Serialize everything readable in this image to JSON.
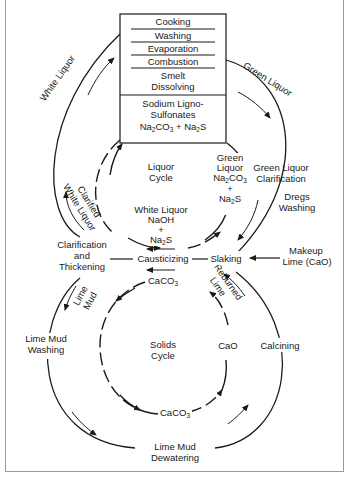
{
  "diagram": {
    "title_box": {
      "steps": [
        "Cooking",
        "Washing",
        "Evaporation",
        "Combustion",
        "Smelt",
        "Dissolving"
      ],
      "products": {
        "line1": "Sodium Ligno-",
        "line2": "Sulfonates",
        "formula_a": "Na",
        "formula_a_sub": "2",
        "formula_a_rest": "CO",
        "formula_a_sub2": "3",
        "plus": "+",
        "formula_b": "Na",
        "formula_b_sub": "2",
        "formula_b_rest": "S"
      }
    },
    "outer_labels": {
      "white_liquor": "White Liquor",
      "green_liquor": "Green Liquor",
      "green_liquor_clarification_1": "Green Liquor",
      "green_liquor_clarification_2": "Clarification",
      "dregs_washing_1": "Dregs",
      "dregs_washing_2": "Washing",
      "clarified_white_liquor_1": "Clarified",
      "clarified_white_liquor_2": "White Liquor",
      "clarification_1": "Clarification",
      "clarification_2": "and",
      "clarification_3": "Thickening",
      "causticizing": "Causticizing",
      "slaking": "Slaking",
      "makeup_lime_1": "Makeup",
      "makeup_lime_2": "Lime (CaO)",
      "lime_mud_1": "Lime",
      "lime_mud_2": "Mud",
      "reburned_lime_1": "Reburned",
      "reburned_lime_2": "Lime",
      "lime_mud_washing_1": "Lime Mud",
      "lime_mud_washing_2": "Washing",
      "calcining": "Calcining",
      "lime_mud_dewatering_1": "Lime Mud",
      "lime_mud_dewatering_2": "Dewatering"
    },
    "liquor_cycle": {
      "title_1": "Liquor",
      "title_2": "Cycle",
      "green_1": "Green",
      "green_2": "Liquor",
      "green_3": "Na",
      "green_3_sub": "2",
      "green_3_rest": "CO",
      "green_3_sub2": "3",
      "green_plus": "+",
      "green_4": "Na",
      "green_4_sub": "2",
      "green_4_rest": "S",
      "white_1": "White Liquor",
      "white_2": "NaOH",
      "white_plus": "+",
      "white_3": "Na",
      "white_3_sub": "2",
      "white_3_rest": "S"
    },
    "solids_cycle": {
      "title_1": "Solids",
      "title_2": "Cycle",
      "caco3_top": "CaCO",
      "caco3_top_sub": "3",
      "cao": "CaO",
      "caco3_bottom": "CaCO",
      "caco3_bottom_sub": "3"
    },
    "colors": {
      "ink": "#1a1a1a",
      "frame": "#9a9a9a",
      "background": "#ffffff"
    }
  }
}
